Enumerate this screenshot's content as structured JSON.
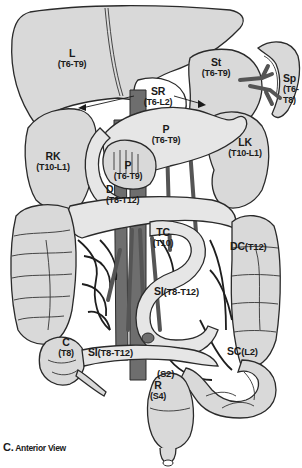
{
  "figure": {
    "caption_letter": "C.",
    "caption_text": "Anterior View"
  },
  "organs": [
    {
      "id": "liver",
      "abbr": "L",
      "segments": "(T6-T9)"
    },
    {
      "id": "stomach",
      "abbr": "St",
      "segments": "(T6-T9)"
    },
    {
      "id": "spleen",
      "abbr": "Sp",
      "segments_line1": "(T6-",
      "segments_line2": "T8)"
    },
    {
      "id": "suprarenal",
      "abbr": "SR",
      "segments": "(T6-L2)"
    },
    {
      "id": "pancreas-body",
      "abbr": "P",
      "segments": "(T6-T9)"
    },
    {
      "id": "right-kidney",
      "abbr": "RK",
      "segments": "(T10-L1)"
    },
    {
      "id": "left-kidney",
      "abbr": "LK",
      "segments": "(T10-L1)"
    },
    {
      "id": "pancreas-head",
      "abbr": "P",
      "segments": "(T6-T9)"
    },
    {
      "id": "duodenum",
      "abbr": "D",
      "segments": "(T8-T12)"
    },
    {
      "id": "transverse-colon",
      "abbr": "TC",
      "segments": "(T10)"
    },
    {
      "id": "descending-colon",
      "abbr": "DC",
      "segments": "(T12)"
    },
    {
      "id": "small-intestine-upper",
      "abbr": "SI",
      "segments": "(T8-T12)"
    },
    {
      "id": "cecum",
      "abbr": "C",
      "segments": "(T8)"
    },
    {
      "id": "small-intestine-lower",
      "abbr": "SI",
      "segments": "(T8-T12)"
    },
    {
      "id": "sigmoid-colon",
      "abbr": "SC",
      "segments": "(L2)"
    },
    {
      "id": "rectum",
      "abbr": "R",
      "segments": "(S4)"
    },
    {
      "id": "rectosigmoid",
      "abbr": "",
      "segments": "(S2)"
    }
  ],
  "colors": {
    "organ_fill": "#d9d9d9",
    "vessel_fill": "#6e6e6e",
    "outline": "#2a2a2a",
    "background": "#ffffff"
  }
}
